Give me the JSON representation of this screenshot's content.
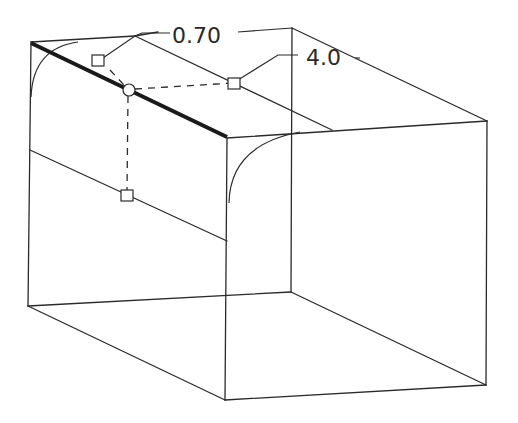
{
  "diagram": {
    "type": "isometric-wireframe",
    "colors": {
      "line": "#2a2a2a",
      "bold_edge": "#1a1a1a",
      "background": "#ffffff"
    },
    "dimensions": [
      {
        "id": "radius-start",
        "label": "0.70"
      },
      {
        "id": "radius-end",
        "label": "4.0"
      }
    ],
    "handles": [
      {
        "id": "handle-start",
        "shape": "square"
      },
      {
        "id": "handle-end",
        "shape": "square"
      },
      {
        "id": "handle-mid",
        "shape": "circle"
      },
      {
        "id": "handle-side",
        "shape": "square"
      }
    ],
    "selected_edge": "top-front edge (bold)"
  }
}
